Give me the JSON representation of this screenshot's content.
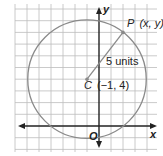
{
  "figure": {
    "type": "circle-on-coordinate-plane",
    "x_axis_label": "x",
    "y_axis_label": "y",
    "origin_label": "O",
    "x_range": [
      -7,
      4
    ],
    "y_range": [
      -2,
      10
    ],
    "colors": {
      "grid": "#bdbdbd",
      "axis": "#222222",
      "circle": "#8a8a8a",
      "radius": "#8a8a8a"
    },
    "circle": {
      "center": {
        "x": -1,
        "y": 4
      },
      "radius": 5
    },
    "center_label": "C (−1, 4)",
    "center_letter": "C",
    "center_coords": "(−1, 4)",
    "point": {
      "x": 2,
      "y": 8
    },
    "point_letter": "P",
    "point_coords": "(x, y)",
    "radius_label": "5 units"
  }
}
